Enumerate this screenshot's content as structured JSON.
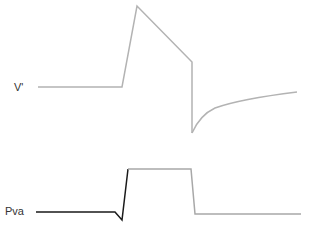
{
  "labels": {
    "v_prime": "V'",
    "pva": "Pva"
  },
  "traces": {
    "v_prime": {
      "color": "#b3b3b3",
      "points": "38,87 122,87 137,6 192,62 192,133"
    },
    "v_prime_recovery": {
      "color": "#b3b3b3",
      "path": "M192,133 Q200,115 215,108 Q240,99 297,92"
    },
    "pva_dark": {
      "color": "#1a1a1a",
      "points": "36,212 115,212 122,220 128,169"
    },
    "pva_light": {
      "color": "#a8a8a8",
      "points": "128,169 191,169 195,214 301,214"
    }
  }
}
